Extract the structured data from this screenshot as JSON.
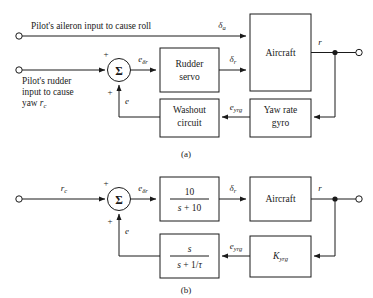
{
  "figure": {
    "type": "control-system-block-diagram",
    "captions": {
      "a": "(a)",
      "b": "(b)"
    }
  },
  "diagram_a": {
    "caption": "(a)",
    "inputs": [
      {
        "name": "aileron-input",
        "label": "Pilot's aileron input to cause roll",
        "lines": [
          "Pilot's aileron input to cause roll"
        ]
      },
      {
        "name": "rudder-input",
        "label": "Pilot's rudder input to cause yaw r_c",
        "lines": [
          "Pilot's rudder",
          "input to cause",
          "yaw"
        ],
        "trailing_symbol": "r",
        "trailing_subscript": "c"
      }
    ],
    "blocks": [
      {
        "name": "rudder-servo",
        "lines": [
          "Rudder",
          "servo"
        ]
      },
      {
        "name": "aircraft",
        "lines": [
          "Aircraft"
        ]
      },
      {
        "name": "washout-circuit",
        "lines": [
          "Washout",
          "circuit"
        ]
      },
      {
        "name": "yaw-rate-gyro",
        "lines": [
          "Yaw rate",
          "gyro"
        ]
      }
    ],
    "summing_junction": {
      "symbol": "Σ",
      "sign_top": "+",
      "sign_bottom": "+"
    },
    "signals": [
      {
        "name": "delta-a",
        "symbol": "δ",
        "subscript": "a"
      },
      {
        "name": "e-delta-r",
        "symbol": "e",
        "subscript": "δr"
      },
      {
        "name": "delta-r",
        "symbol": "δ",
        "subscript": "r"
      },
      {
        "name": "r-output",
        "symbol": "r",
        "subscript": ""
      },
      {
        "name": "e-yrg",
        "symbol": "e",
        "subscript": "yrg"
      },
      {
        "name": "e-feedback",
        "symbol": "e",
        "subscript": ""
      }
    ]
  },
  "diagram_b": {
    "caption": "(b)",
    "inputs": [
      {
        "name": "rc-input",
        "symbol": "r",
        "subscript": "c"
      }
    ],
    "blocks": [
      {
        "name": "rudder-servo-tf",
        "numerator": "10",
        "denominator": "s + 10"
      },
      {
        "name": "aircraft",
        "lines": [
          "Aircraft"
        ]
      },
      {
        "name": "washout-tf",
        "numerator": "s",
        "denominator": "s + 1/τ"
      },
      {
        "name": "gyro-gain",
        "symbol": "K",
        "subscript": "yrg"
      }
    ],
    "summing_junction": {
      "symbol": "Σ",
      "sign_top": "+",
      "sign_bottom": "+"
    },
    "signals": [
      {
        "name": "e-delta-r",
        "symbol": "e",
        "subscript": "δr"
      },
      {
        "name": "delta-r",
        "symbol": "δ",
        "subscript": "r"
      },
      {
        "name": "r-output",
        "symbol": "r",
        "subscript": ""
      },
      {
        "name": "e-yrg",
        "symbol": "e",
        "subscript": "yrg"
      },
      {
        "name": "e-feedback",
        "symbol": "e",
        "subscript": ""
      }
    ]
  },
  "colors": {
    "line": "#1a1a1a",
    "background": "#ffffff"
  }
}
